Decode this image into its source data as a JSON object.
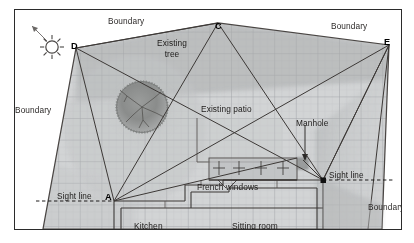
{
  "diagram": {
    "type": "site-plan",
    "frame": {
      "x": 14,
      "y": 9,
      "width": 386,
      "height": 219
    },
    "colors": {
      "ink": "#231f20",
      "line": "#3a3633",
      "grid": "#b9bcc0",
      "fill_garden": "#cfd1d2",
      "fill_shadow": "#b0b2b3",
      "tree": "#8d8f8e",
      "border": "#2b2b2b"
    },
    "sun": {
      "name": "sun-icon",
      "cx": 39,
      "cy": 33,
      "r": 6
    },
    "vertices": [
      {
        "id": "A",
        "label": "A",
        "x": 113,
        "y": 200,
        "label_x": 104,
        "label_y": 192
      },
      {
        "id": "C",
        "label": "C",
        "x": 217,
        "y": 22,
        "label_x": 213,
        "label_y": 20
      },
      {
        "id": "D",
        "label": "D",
        "x": 75,
        "y": 47,
        "label_x": 70,
        "label_y": 41
      },
      {
        "id": "E",
        "label": "E",
        "x": 388,
        "y": 44,
        "label_x": 382,
        "label_y": 37
      },
      {
        "id": "B",
        "label": "",
        "x": 322,
        "y": 180,
        "label_x": 0,
        "label_y": 0
      }
    ],
    "boundary_labels": [
      {
        "text": "Boundary",
        "x": 107,
        "y": 17
      },
      {
        "text": "Boundary",
        "x": 330,
        "y": 22
      },
      {
        "text": "Boundary",
        "x": 13,
        "y": 106
      },
      {
        "text": "Boundary",
        "x": 368,
        "y": 203
      }
    ],
    "annotations": [
      {
        "name": "existing-tree-label",
        "lines": [
          "Existing",
          "tree"
        ],
        "x": 152,
        "y": 38
      },
      {
        "name": "existing-patio-label",
        "lines": [
          "Existing patio"
        ],
        "x": 207,
        "y": 104
      },
      {
        "name": "manhole-label",
        "lines": [
          "Manhole"
        ],
        "x": 304,
        "y": 118
      },
      {
        "name": "french-windows-label",
        "lines": [
          "French windows"
        ],
        "x": 212,
        "y": 181
      }
    ],
    "sight_lines": [
      {
        "name": "sight-line-left",
        "text": "Sight line",
        "x": 59,
        "y": 192,
        "from_x": 35,
        "from_y": 200,
        "to_x": 113,
        "to_y": 200
      },
      {
        "name": "sight-line-right",
        "text": "Sight line",
        "x": 333,
        "y": 171,
        "from_x": 322,
        "from_y": 180,
        "to_x": 393,
        "to_y": 180
      }
    ],
    "rooms": [
      {
        "name": "kitchen",
        "label": "Kitchen",
        "x": 148,
        "y": 224
      },
      {
        "name": "sitting-room",
        "label": "Sitting room",
        "x": 251,
        "y": 224
      }
    ]
  }
}
